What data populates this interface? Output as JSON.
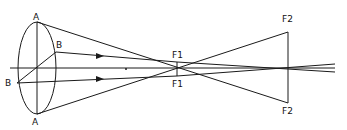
{
  "diagram": {
    "labels": {
      "a_top": "A",
      "a_bottom": "A",
      "b_top": "B",
      "b_bottom": "B",
      "f1_top": "F1",
      "f1_bottom": "F1",
      "f2_top": "F2",
      "f2_bottom": "F2"
    },
    "colors": {
      "line": "#1a1a1a",
      "background": "#ffffff"
    }
  }
}
